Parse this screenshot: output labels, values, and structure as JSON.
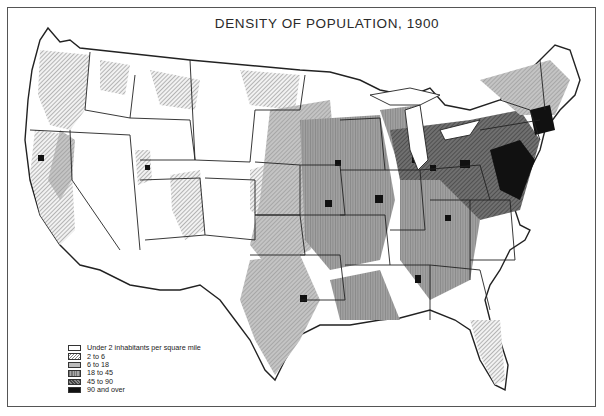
{
  "title": "DENSITY OF POPULATION, 1900",
  "legend": {
    "items": [
      {
        "label": "Under 2 inhabitants per square mile",
        "pattern": "white"
      },
      {
        "label": "2 to 6",
        "pattern": "light-hatch"
      },
      {
        "label": "6 to 18",
        "pattern": "light-gray-stipple"
      },
      {
        "label": "18 to 45",
        "pattern": "medium-gray-vertical"
      },
      {
        "label": "45 to 90",
        "pattern": "dark-gray-crosshatch"
      },
      {
        "label": "90 and over",
        "pattern": "black"
      }
    ]
  },
  "colors": {
    "under_2": "#ffffff",
    "2_to_6": "#d9d9d9",
    "6_to_18": "#b8b8b8",
    "18_to_45": "#8f8f8f",
    "45_to_90": "#5e5e5e",
    "90_and_over": "#111111",
    "border": "#222222"
  }
}
